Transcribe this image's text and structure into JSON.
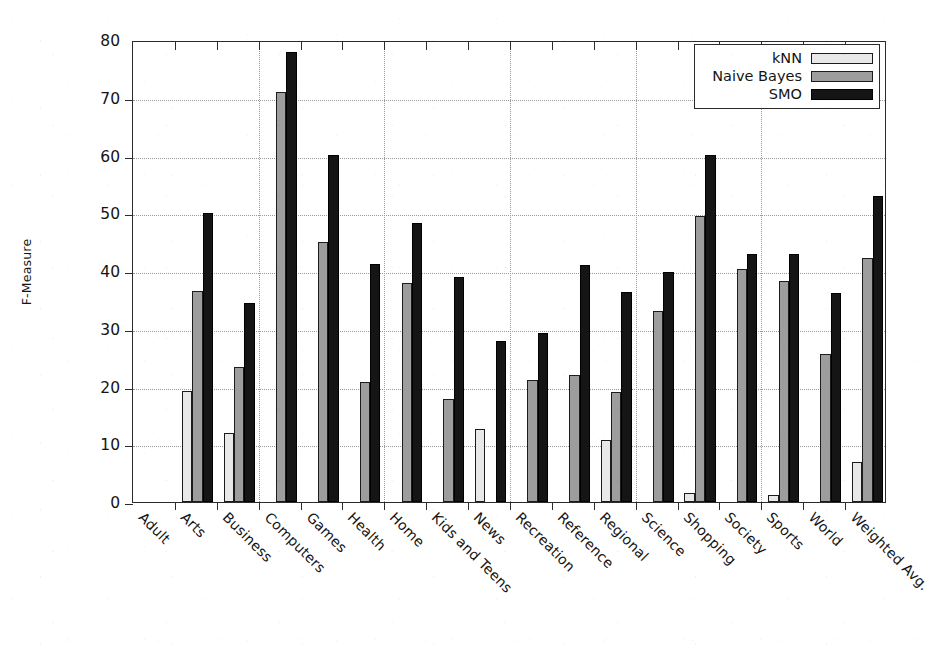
{
  "chart_data": {
    "type": "bar",
    "title": "",
    "xlabel": "",
    "ylabel": "F-Measure",
    "ylim": [
      0,
      80
    ],
    "yticks": [
      0,
      10,
      20,
      30,
      40,
      50,
      60,
      70,
      80
    ],
    "grid": true,
    "legend_position": "top-right",
    "legend_entries": [
      "kNN",
      "Naive Bayes",
      "SMO"
    ],
    "categories": [
      "Adult",
      "Arts",
      "Business",
      "Computers",
      "Games",
      "Health",
      "Home",
      "Kids and Teens",
      "News",
      "Recreation",
      "Reference",
      "Regional",
      "Science",
      "Shopping",
      "Society",
      "Sports",
      "World",
      "Weighted Avg."
    ],
    "series": [
      {
        "name": "kNN",
        "color": "#e8e8e8",
        "values": [
          0,
          19.3,
          12.0,
          0,
          0,
          0,
          0,
          0,
          12.6,
          0,
          0,
          10.8,
          0,
          1.5,
          0,
          1.2,
          0,
          7.0
        ]
      },
      {
        "name": "Naive Bayes",
        "color": "#9d9d9d",
        "values": [
          0,
          36.5,
          23.3,
          71.0,
          45.1,
          20.8,
          38.0,
          17.8,
          0,
          21.2,
          22.0,
          19.0,
          33.0,
          49.5,
          40.3,
          38.3,
          25.7,
          42.2
        ]
      },
      {
        "name": "SMO",
        "color": "#151515",
        "values": [
          0,
          50.1,
          34.5,
          78.0,
          60.1,
          41.2,
          48.3,
          39.0,
          27.9,
          29.2,
          41.0,
          36.4,
          39.8,
          60.1,
          43.0,
          43.0,
          36.2,
          53.0
        ]
      }
    ]
  },
  "axis": {
    "y_title": "F-Measure",
    "y_tick_labels": [
      "0",
      "10",
      "20",
      "30",
      "40",
      "50",
      "60",
      "70",
      "80"
    ]
  },
  "legend": {
    "items": [
      {
        "label": "kNN",
        "swatch_class": "s-knn"
      },
      {
        "label": "Naive Bayes",
        "swatch_class": "s-nb"
      },
      {
        "label": "SMO",
        "swatch_class": "s-smo"
      }
    ]
  }
}
